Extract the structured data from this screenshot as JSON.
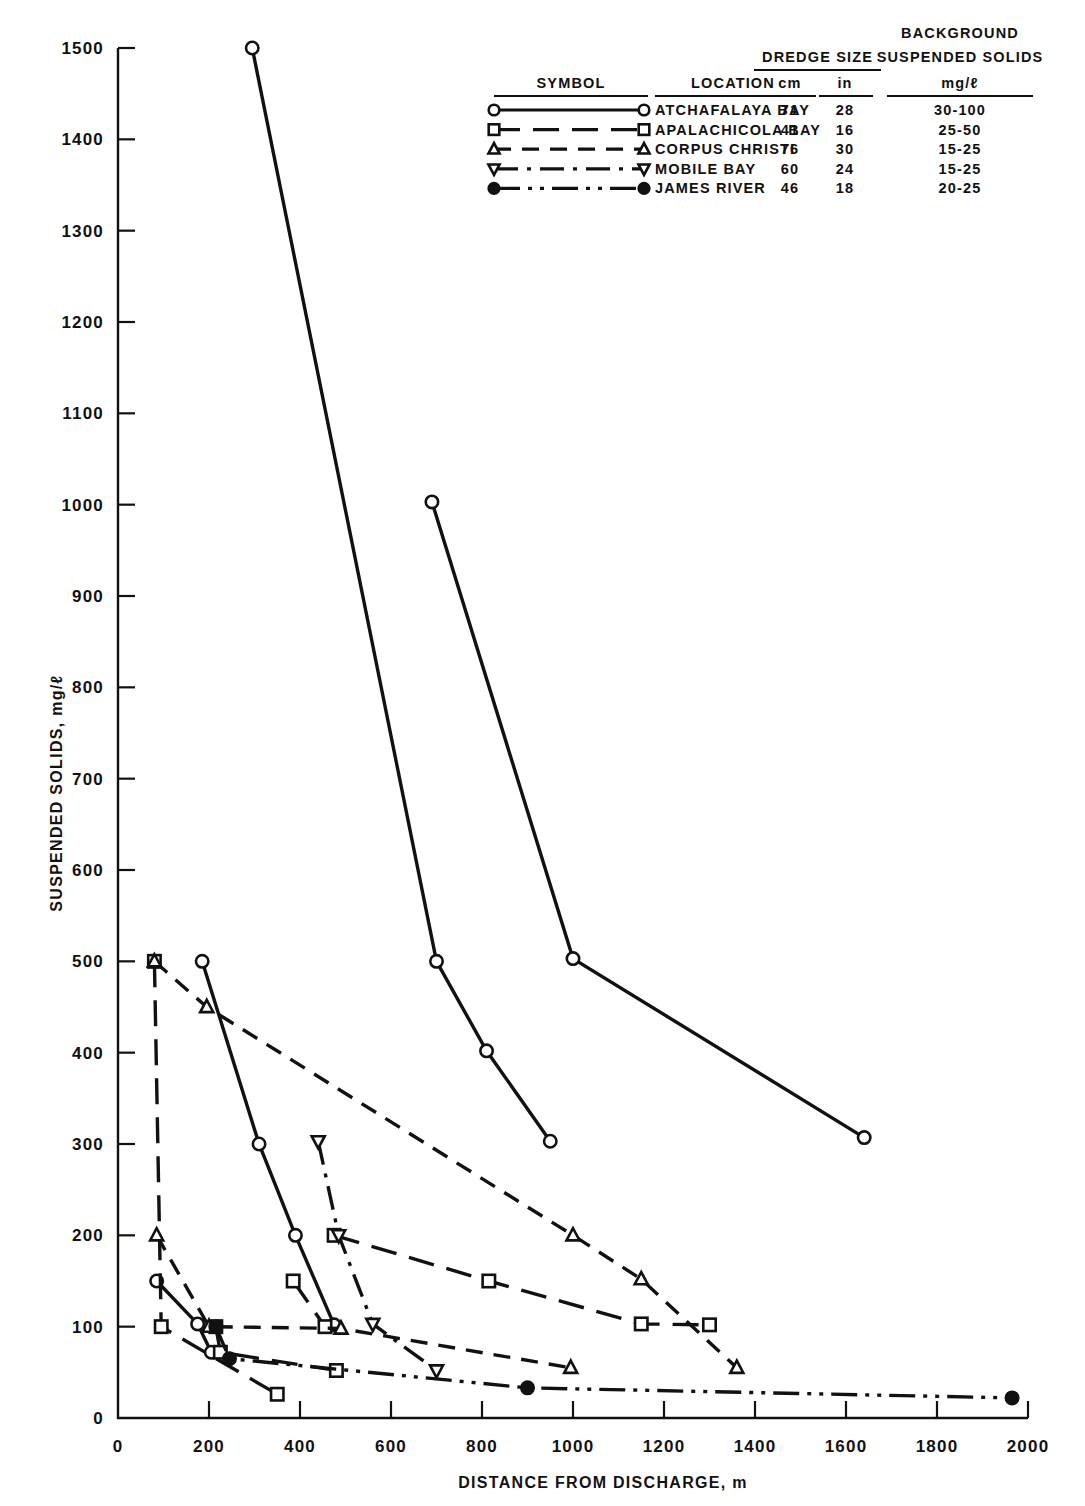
{
  "chart_data": {
    "type": "line",
    "title": "",
    "xlabel": "DISTANCE FROM DISCHARGE, m",
    "ylabel": "SUSPENDED SOLIDS, mg/ℓ",
    "xlim": [
      0,
      2000
    ],
    "ylim": [
      0,
      1500
    ],
    "xticks": [
      0,
      200,
      400,
      600,
      800,
      1000,
      1200,
      1400,
      1600,
      1800,
      2000
    ],
    "yticks": [
      0,
      100,
      200,
      300,
      400,
      500,
      600,
      700,
      800,
      900,
      1000,
      1100,
      1200,
      1300,
      1400,
      1500
    ],
    "xtick_labels": [
      "0",
      "200",
      "400",
      "600",
      "800",
      "1000",
      "1200",
      "1400",
      "1600",
      "1800",
      "2000"
    ],
    "ytick_labels": [
      "0",
      "100",
      "200",
      "300",
      "400",
      "500",
      "600",
      "700",
      "800",
      "900",
      "1000",
      "1100",
      "1200",
      "1300",
      "1400",
      "1500"
    ],
    "grid": false,
    "legend_position": "top-right",
    "series": [
      {
        "name": "ATCHAFALAYA BAY",
        "marker": "circle-open",
        "linestyle": "solid",
        "dasharray": "none",
        "curves": [
          {
            "x": [
              295,
              700,
              810,
              950
            ],
            "y": [
              1500,
              500,
              402,
              303
            ]
          },
          {
            "x": [
              690,
              1000,
              1640
            ],
            "y": [
              1003,
              503,
              307
            ]
          },
          {
            "x": [
              185,
              310,
              390,
              475
            ],
            "y": [
              500,
              300,
              200,
              102
            ]
          },
          {
            "x": [
              85,
              175,
              205
            ],
            "y": [
              150,
              103,
              72
            ]
          }
        ]
      },
      {
        "name": "APALACHICOLA BAY",
        "marker": "square-open",
        "linestyle": "long-dash",
        "dasharray": "26 13",
        "curves": [
          {
            "x": [
              80,
              95,
              350
            ],
            "y": [
              500,
              100,
              26
            ]
          },
          {
            "x": [
              475,
              815,
              1150,
              1300
            ],
            "y": [
              200,
              150,
              103,
              102
            ]
          },
          {
            "x": [
              385,
              455
            ],
            "y": [
              150,
              100
            ]
          },
          {
            "x": [
              215,
              225,
              480
            ],
            "y": [
              100,
              72,
              52
            ]
          }
        ]
      },
      {
        "name": "CORPUS CHRISTI",
        "marker": "triangle-up-open",
        "linestyle": "dashed",
        "dasharray": "17 11",
        "curves": [
          {
            "x": [
              80,
              195,
              1000,
              1150,
              1360
            ],
            "y": [
              500,
              450,
              200,
              152,
              55
            ]
          },
          {
            "x": [
              85,
              200,
              490,
              995
            ],
            "y": [
              200,
              100,
              98,
              55
            ]
          }
        ]
      },
      {
        "name": "MOBILE BAY",
        "marker": "triangle-down-open",
        "linestyle": "dash-dot",
        "dasharray": "24 9 4 9",
        "curves": [
          {
            "x": [
              440,
              485,
              560,
              700
            ],
            "y": [
              303,
              200,
              103,
              52
            ]
          }
        ]
      },
      {
        "name": "JAMES RIVER",
        "marker": "circle-filled",
        "linestyle": "dash-dot-dot",
        "dasharray": "26 8 4 8 4 8",
        "curves": [
          {
            "x": [
              215,
              245,
              900,
              1965
            ],
            "y": [
              100,
              65,
              33,
              22
            ]
          }
        ]
      }
    ]
  },
  "legend": {
    "headers": {
      "symbol": "SYMBOL",
      "location": "LOCATION",
      "dredge_size": "DREDGE SIZE",
      "dredge_cm": "cm",
      "dredge_in": "in",
      "background_line1": "BACKGROUND",
      "background_line2": "SUSPENDED SOLIDS",
      "background_units": "mg/ℓ"
    },
    "rows": [
      {
        "location": "ATCHAFALAYA BAY",
        "cm": "71",
        "in": "28",
        "background": "30-100",
        "marker": "circle-open",
        "dasharray": "none"
      },
      {
        "location": "APALACHICOLA BAY",
        "cm": "41",
        "in": "16",
        "background": "25-50",
        "marker": "square-open",
        "dasharray": "26 13"
      },
      {
        "location": "CORPUS CHRISTI",
        "cm": "76",
        "in": "30",
        "background": "15-25",
        "marker": "triangle-up-open",
        "dasharray": "17 11"
      },
      {
        "location": "MOBILE BAY",
        "cm": "60",
        "in": "24",
        "background": "15-25",
        "marker": "triangle-down-open",
        "dasharray": "24 9 4 9"
      },
      {
        "location": "JAMES RIVER",
        "cm": "46",
        "in": "18",
        "background": "20-25",
        "marker": "circle-filled",
        "dasharray": "26 8 4 8 4 8"
      }
    ]
  },
  "colors": {
    "ink": "#111111",
    "paper": "#ffffff"
  }
}
